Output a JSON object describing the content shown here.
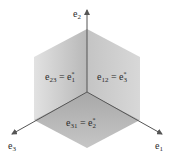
{
  "diagram": {
    "axes": [
      {
        "id": "e2",
        "label": "e",
        "sub": "2",
        "direction": "up"
      },
      {
        "id": "e3",
        "label": "e",
        "sub": "3",
        "direction": "down-left"
      },
      {
        "id": "e1",
        "label": "e",
        "sub": "1",
        "direction": "down-right"
      }
    ],
    "faces": [
      {
        "id": "left",
        "lhs": "e",
        "lhs_sub": "23",
        "eq": " = ",
        "rhs": "e",
        "rhs_sub": "1",
        "rhs_sup": "*"
      },
      {
        "id": "right",
        "lhs": "e",
        "lhs_sub": "12",
        "eq": " = ",
        "rhs": "e",
        "rhs_sub": "3",
        "rhs_sup": "*"
      },
      {
        "id": "bottom",
        "lhs": "e",
        "lhs_sub": "31",
        "eq": " = ",
        "rhs": "e",
        "rhs_sub": "2",
        "rhs_sup": "*"
      }
    ],
    "colors": {
      "face_light": "#e4e4e4",
      "face_mid": "#c9c9c9",
      "face_dark": "#a9a9a9",
      "axis": "#6a6a6a"
    }
  }
}
